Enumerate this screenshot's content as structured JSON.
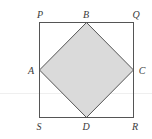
{
  "diagram": {
    "type": "geometry-figure",
    "colors": {
      "outer_stroke": "#555555",
      "inner_stroke": "#555555",
      "inner_fill": "#dadada",
      "label": "#3a3a3a",
      "background": "#ffffff"
    },
    "outer_square": {
      "name": "PQRS",
      "vertices": {
        "P": [
          39.5,
          22.5
        ],
        "Q": [
          133.5,
          22.5
        ],
        "R": [
          133.5,
          117.5
        ],
        "S": [
          39.5,
          117.5
        ]
      }
    },
    "inner_square": {
      "name": "ABCD",
      "shaded": true,
      "vertices": {
        "A": [
          39.5,
          70
        ],
        "B": [
          86.5,
          22.5
        ],
        "C": [
          133.5,
          70
        ],
        "D": [
          86.5,
          117.5
        ]
      }
    },
    "labels": [
      {
        "id": "P",
        "text": "P",
        "x": 40,
        "y": 15
      },
      {
        "id": "B",
        "text": "B",
        "x": 86,
        "y": 15
      },
      {
        "id": "Q",
        "text": "Q",
        "x": 136,
        "y": 15
      },
      {
        "id": "A",
        "text": "A",
        "x": 31,
        "y": 71
      },
      {
        "id": "C",
        "text": "C",
        "x": 142,
        "y": 71
      },
      {
        "id": "S",
        "text": "S",
        "x": 39,
        "y": 127
      },
      {
        "id": "D",
        "text": "D",
        "x": 86,
        "y": 127
      },
      {
        "id": "R",
        "text": "R",
        "x": 135,
        "y": 127
      }
    ]
  }
}
